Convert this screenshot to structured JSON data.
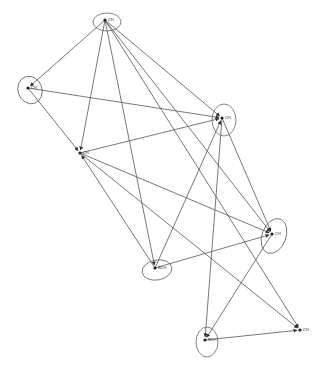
{
  "diagram": {
    "type": "directed-network",
    "background": "#ffffff",
    "edge_color": "#555555",
    "nodes": [
      {
        "id": "n1",
        "label": "CH",
        "x": 105,
        "y": 20,
        "rx": 14,
        "ry": 9,
        "rot": 0
      },
      {
        "id": "n2",
        "label": "CH",
        "x": 28,
        "y": 88,
        "rx": 12,
        "ry": 14,
        "rot": -20
      },
      {
        "id": "n3",
        "label": "CH",
        "x": 222,
        "y": 118,
        "rx": 12,
        "ry": 16,
        "rot": 0
      },
      {
        "id": "n4",
        "label": "CH",
        "x": 80,
        "y": 153,
        "rx": 0,
        "ry": 0,
        "rot": 0
      },
      {
        "id": "n5",
        "label": "CH",
        "x": 272,
        "y": 234,
        "rx": 12,
        "ry": 18,
        "rot": 20
      },
      {
        "id": "n6",
        "label": "BCH",
        "x": 155,
        "y": 268,
        "rx": 15,
        "ry": 10,
        "rot": -10
      },
      {
        "id": "n7",
        "label": "BCH",
        "x": 205,
        "y": 340,
        "rx": 11,
        "ry": 15,
        "rot": 0
      },
      {
        "id": "n8",
        "label": "CH",
        "x": 300,
        "y": 330,
        "rx": 0,
        "ry": 0,
        "rot": 0
      }
    ],
    "edges": [
      {
        "from": "n1",
        "to": "n2"
      },
      {
        "from": "n1",
        "to": "n4"
      },
      {
        "from": "n1",
        "to": "n6"
      },
      {
        "from": "n1",
        "to": "n3"
      },
      {
        "from": "n1",
        "to": "n5"
      },
      {
        "from": "n1",
        "to": "n8"
      },
      {
        "from": "n2",
        "to": "n3"
      },
      {
        "from": "n2",
        "to": "n4"
      },
      {
        "from": "n4",
        "to": "n3"
      },
      {
        "from": "n4",
        "to": "n5"
      },
      {
        "from": "n4",
        "to": "n8"
      },
      {
        "from": "n6",
        "to": "n3"
      },
      {
        "from": "n6",
        "to": "n5"
      },
      {
        "from": "n6",
        "to": "n4"
      },
      {
        "from": "n3",
        "to": "n5"
      },
      {
        "from": "n3",
        "to": "n7"
      },
      {
        "from": "n5",
        "to": "n7"
      },
      {
        "from": "n7",
        "to": "n8"
      }
    ]
  }
}
